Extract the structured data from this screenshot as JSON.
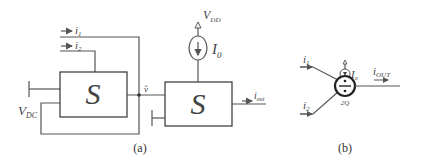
{
  "figure": {
    "panel_a": {
      "caption": "(a)",
      "left_block": {
        "label": "S"
      },
      "right_block": {
        "label": "S"
      },
      "inputs": {
        "i1": "i",
        "i1_sub": "1",
        "i2": "i",
        "i2_sub": "2"
      },
      "bias_voltage": {
        "main": "V",
        "sub": "DC"
      },
      "node_voltage": "v̂",
      "supply": {
        "main": "V",
        "sub": "DD"
      },
      "current_source": {
        "main": "I",
        "sub": "0"
      },
      "output": {
        "main": "i",
        "sub": "out"
      }
    },
    "panel_b": {
      "caption": "(b)",
      "inputs": {
        "i1": "i",
        "i1_sub": "1",
        "i2": "i",
        "i2_sub": "2"
      },
      "current_source": {
        "main": "I",
        "sub": "o"
      },
      "output": {
        "main": "i",
        "sub": "OUT"
      },
      "operator_symbol": "÷",
      "operator_sub": "2Q"
    }
  }
}
